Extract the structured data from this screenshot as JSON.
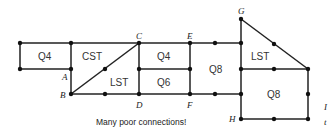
{
  "diagram": {
    "caption": "Many poor connections!",
    "node_labels": {
      "A": "A",
      "B": "B",
      "C": "C",
      "D": "D",
      "E": "E",
      "F": "F",
      "G": "G",
      "H": "H"
    },
    "elements": [
      {
        "id": "q4-left",
        "label": "Q4"
      },
      {
        "id": "cst",
        "label": "CST"
      },
      {
        "id": "lst-left",
        "label": "LST"
      },
      {
        "id": "q4-mid",
        "label": "Q4"
      },
      {
        "id": "q6",
        "label": "Q6"
      },
      {
        "id": "q8-mid",
        "label": "Q8"
      },
      {
        "id": "lst-right",
        "label": "LST"
      },
      {
        "id": "q8-right",
        "label": "Q8"
      }
    ],
    "edge_text": [
      "I",
      "t"
    ]
  }
}
